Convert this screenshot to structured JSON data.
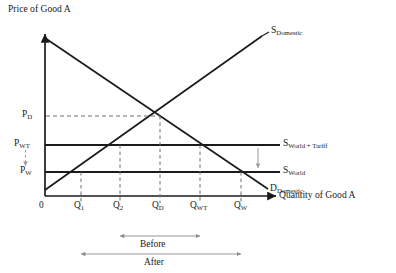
{
  "figure": {
    "type": "supply-demand-tariff-diagram",
    "axes": {
      "y_axis_label": "Price of Good A",
      "x_axis_label": "Quantity of Good A",
      "origin_label": "0"
    },
    "price_ticks": [
      {
        "id": "pd",
        "base": "P",
        "sub": "D",
        "text": "PD",
        "y_px": 116
      },
      {
        "id": "pwt",
        "base": "P",
        "sub": "WT",
        "text": "PWT",
        "y_px": 145
      },
      {
        "id": "pw",
        "base": "P",
        "sub": "W",
        "text": "PW",
        "y_px": 172
      }
    ],
    "quantity_ticks": [
      {
        "id": "q1",
        "base": "Q",
        "sub": "1",
        "text": "Q1",
        "x_px": 81
      },
      {
        "id": "q2",
        "base": "Q",
        "sub": "2",
        "text": "Q2",
        "x_px": 120
      },
      {
        "id": "qd",
        "base": "Q",
        "sub": "D",
        "text": "QD",
        "x_px": 160
      },
      {
        "id": "qwt",
        "base": "Q",
        "sub": "WT",
        "text": "QWT",
        "x_px": 200
      },
      {
        "id": "qw",
        "base": "Q",
        "sub": "W",
        "text": "QW",
        "x_px": 241
      }
    ],
    "curves": [
      {
        "id": "s_domestic",
        "base": "S",
        "sub": "Domestic",
        "text": "SDomestic"
      },
      {
        "id": "s_world_tariff",
        "base": "S",
        "sub": "World + Tariff",
        "text": "SWorld + Tariff"
      },
      {
        "id": "s_world",
        "base": "S",
        "sub": "World",
        "text": "SWorld"
      },
      {
        "id": "d_domestic",
        "base": "D",
        "sub": "Domestic",
        "text": "DDomestic"
      }
    ],
    "spans": [
      {
        "id": "before",
        "label": "Before",
        "from_tick": "q2",
        "to_tick": "qwt"
      },
      {
        "id": "after",
        "label": "After",
        "from_tick": "q1",
        "to_tick": "qw"
      }
    ],
    "colors": {
      "line": "#1a1a1a",
      "guide": "#7a7a7a",
      "background": "#ffffff"
    }
  }
}
